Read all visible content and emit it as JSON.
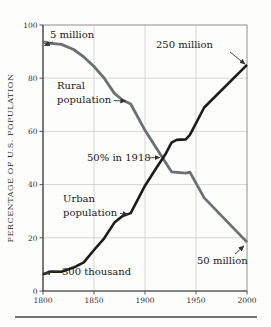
{
  "figure": {
    "background_color": "#fdfdfc",
    "grid_color": "#d6d6d6",
    "axis_color": "#454545",
    "border_color": "#8f8f8f",
    "annotation_arrow_color": "#333333"
  },
  "chart_data": {
    "type": "line",
    "title": "",
    "xlabel": "",
    "ylabel": "PERCENTAGE OF U.S. POPULATION",
    "xlim": [
      1800,
      2000
    ],
    "ylim": [
      0,
      100
    ],
    "x_ticks": [
      1800,
      1850,
      1900,
      1950,
      2000
    ],
    "y_ticks": [
      0,
      20,
      40,
      60,
      80,
      100
    ],
    "grid": true,
    "legend_position": "none",
    "series": [
      {
        "id": "rural",
        "name": "Rural population",
        "color": "#6b7073",
        "width": 2.8,
        "points": [
          [
            1800,
            93.6
          ],
          [
            1808,
            93.1
          ],
          [
            1818,
            92.7
          ],
          [
            1830,
            90.8
          ],
          [
            1840,
            88.0
          ],
          [
            1850,
            84.4
          ],
          [
            1860,
            80.0
          ],
          [
            1870,
            74.3
          ],
          [
            1878,
            71.8
          ],
          [
            1886,
            70.3
          ],
          [
            1900,
            60.4
          ],
          [
            1910,
            54.4
          ],
          [
            1920,
            48.4
          ],
          [
            1926,
            44.8
          ],
          [
            1940,
            44.3
          ],
          [
            1944,
            44.7
          ],
          [
            1958,
            35.0
          ],
          [
            2000,
            18.4
          ]
        ]
      },
      {
        "id": "urban",
        "name": "Urban population",
        "color": "#1c1c1c",
        "width": 2.6,
        "points": [
          [
            1800,
            6.3
          ],
          [
            1808,
            7.3
          ],
          [
            1818,
            7.2
          ],
          [
            1830,
            8.8
          ],
          [
            1840,
            10.8
          ],
          [
            1850,
            15.4
          ],
          [
            1860,
            19.8
          ],
          [
            1870,
            25.7
          ],
          [
            1878,
            28.2
          ],
          [
            1886,
            29.3
          ],
          [
            1900,
            39.6
          ],
          [
            1910,
            45.6
          ],
          [
            1920,
            51.4
          ],
          [
            1926,
            55.8
          ],
          [
            1931,
            56.8
          ],
          [
            1940,
            57.0
          ],
          [
            1944,
            58.7
          ],
          [
            1958,
            69.0
          ],
          [
            2000,
            85.0
          ]
        ]
      }
    ],
    "annotations": [
      {
        "id": "five-million",
        "lines": [
          "5 million"
        ],
        "x": 50,
        "y": 38,
        "anchor": "start",
        "lh": 14,
        "arrow": {
          "from": [
            53,
            42
          ],
          "tip": [
            1801.5,
            92.3
          ]
        }
      },
      {
        "id": "rural-population",
        "lines": [
          "Rural",
          "population"
        ],
        "x": 57,
        "y": 89,
        "anchor": "start",
        "lh": 14,
        "arrow": {
          "from": [
            114,
            100.5
          ],
          "tip": [
            1881,
            71.3
          ]
        }
      },
      {
        "id": "fifty-percent-1918",
        "lines": [
          "50% in 1918"
        ],
        "x": 87,
        "y": 161,
        "anchor": "start",
        "lh": 14,
        "arrow": {
          "from": [
            149,
            157.8
          ],
          "tip": [
            1914.5,
            50.2
          ]
        }
      },
      {
        "id": "urban-population",
        "lines": [
          "Urban",
          "population"
        ],
        "x": 63,
        "y": 202,
        "anchor": "start",
        "lh": 14,
        "arrow": {
          "from": [
            120,
            213.5
          ],
          "tip": [
            1883,
            28.9
          ]
        }
      },
      {
        "id": "three-hundred-thousand",
        "lines": [
          "300 thousand"
        ],
        "x": 62,
        "y": 275,
        "anchor": "start",
        "lh": 14,
        "arrow": {
          "from": [
            59,
            271
          ],
          "tip": [
            1801.5,
            6.6
          ]
        }
      },
      {
        "id": "two-hundred-fifty-million",
        "lines": [
          "250 million"
        ],
        "x": 156,
        "y": 48,
        "anchor": "start",
        "lh": 14,
        "arrow": {
          "from": [
            230,
            52
          ],
          "tip": [
            1998,
            85.3
          ]
        }
      },
      {
        "id": "fifty-million",
        "lines": [
          "50 million"
        ],
        "x": 197,
        "y": 264,
        "anchor": "start",
        "lh": 14,
        "arrow": {
          "from": [
            235,
            254
          ],
          "tip": [
            1997,
            16.9
          ]
        }
      }
    ]
  }
}
